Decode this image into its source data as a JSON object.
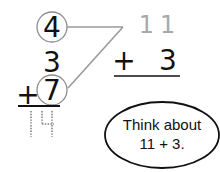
{
  "left_problem": {
    "top_addend": "4",
    "middle_addend": "3",
    "operator": "+",
    "bottom_addend": "7",
    "answer_traced": "14"
  },
  "right_problem": {
    "top_addend_gray": "11",
    "operator": "+",
    "second_addend": "3"
  },
  "hint_bubble": {
    "line1": "Think about",
    "line2": "11 + 3."
  },
  "colors": {
    "ink": "#111111",
    "gray_lines": "#9a9a9a",
    "gray_digits": "#a8a8a8",
    "circle_stroke": "#8c8c8c",
    "dotted": "#9a9a9a"
  }
}
